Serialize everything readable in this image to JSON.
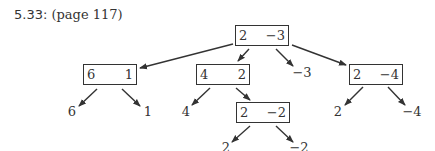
{
  "heading": {
    "number": "5.33:",
    "page_ref": "(page 117)"
  },
  "tree": {
    "root": {
      "left": "2",
      "right": "−3"
    },
    "nodes": [
      {
        "id": "n1",
        "left": "6",
        "right": "1"
      },
      {
        "id": "n2",
        "left": "4",
        "right": "2"
      },
      {
        "id": "n3",
        "left": "2",
        "right": "−4"
      },
      {
        "id": "n4",
        "left": "2",
        "right": "−2"
      }
    ],
    "leaves": {
      "root_middle": "−3",
      "n1_left": "6",
      "n1_right": "1",
      "n2_left": "4",
      "n3_left": "2",
      "n3_right": "−4",
      "n4_left": "2",
      "n4_right": "−2"
    }
  }
}
